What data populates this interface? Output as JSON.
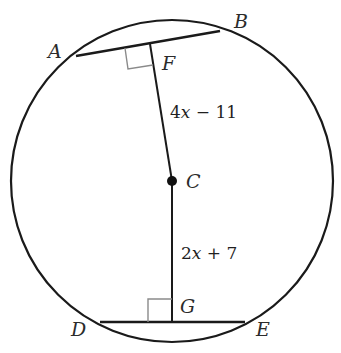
{
  "diagram": {
    "type": "circle-chords",
    "circle": {
      "center_label": "C",
      "cx": 172,
      "cy": 181,
      "r": 161
    },
    "points": {
      "A": {
        "label": "A",
        "x": 76,
        "y": 56
      },
      "B": {
        "label": "B",
        "x": 220,
        "y": 31
      },
      "F": {
        "label": "F",
        "x": 150,
        "y": 44
      },
      "C": {
        "label": "C",
        "x": 172,
        "y": 181
      },
      "G": {
        "label": "G",
        "x": 172,
        "y": 322
      },
      "D": {
        "label": "D",
        "x": 100,
        "y": 322
      },
      "E": {
        "label": "E",
        "x": 245,
        "y": 322
      }
    },
    "segments": [
      {
        "from": "A",
        "to": "B",
        "kind": "chord"
      },
      {
        "from": "D",
        "to": "E",
        "kind": "chord"
      },
      {
        "from": "C",
        "to": "F",
        "kind": "perpendicular",
        "length_label": "4x − 11"
      },
      {
        "from": "C",
        "to": "G",
        "kind": "perpendicular",
        "length_label": "2x + 7"
      }
    ],
    "right_angles": [
      "F",
      "G"
    ],
    "labels": {
      "cf_expr_num": "4",
      "cf_expr_var": "x",
      "cf_expr_rest": " − 11",
      "cg_expr_num": "2",
      "cg_expr_var": "x",
      "cg_expr_rest": " + 7"
    },
    "colors": {
      "stroke": "#1a1a1a",
      "right_angle": "#8a8a8a"
    }
  }
}
